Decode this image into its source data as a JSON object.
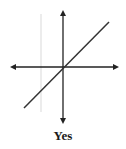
{
  "diagram": {
    "type": "coordinate-axes-with-line",
    "caption": "Yes",
    "colors": {
      "axis": "#222222",
      "line": "#333333",
      "guide": "#cfcfcf"
    },
    "axes": {
      "origin": [
        63,
        67
      ],
      "x_axis": {
        "from": [
          10,
          67
        ],
        "to": [
          119,
          67
        ],
        "arrows": "both"
      },
      "y_axis": {
        "from": [
          63,
          10
        ],
        "to": [
          63,
          124
        ],
        "arrows": "both"
      }
    },
    "line": {
      "from": [
        24,
        108
      ],
      "to": [
        109,
        22
      ],
      "passes_through_origin": true
    },
    "guide_line": {
      "x": 41,
      "y1": 14,
      "y2": 112
    }
  }
}
